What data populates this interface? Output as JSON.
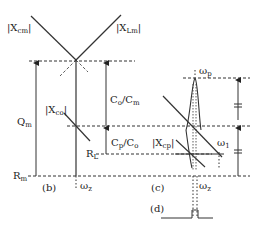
{
  "figure": {
    "panels": {
      "b": "(b)",
      "c": "(c)",
      "d": "(d)"
    },
    "labels": {
      "xcm": {
        "main": "|X",
        "sub": "cm",
        "end": "|"
      },
      "xlm": {
        "main": "|X",
        "sub": "Lm",
        "end": "|"
      },
      "xco": {
        "main": "|X",
        "sub": "co",
        "end": "|"
      },
      "xcp": {
        "main": "|X",
        "sub": "cp",
        "end": "|"
      },
      "qm": {
        "main": "Q",
        "sub": "m"
      },
      "co_cm": {
        "main": "C",
        "sub1": "o",
        "mid": "/C",
        "sub2": "m"
      },
      "cp_co": {
        "main": "C",
        "sub1": "p",
        "mid": "/C",
        "sub2": "o"
      },
      "rl": {
        "main": "R",
        "sub": "L"
      },
      "rm": {
        "main": "R",
        "sub": "m"
      },
      "wz_b": {
        "main": "ω",
        "sub": "z"
      },
      "wz_c": {
        "main": "ω",
        "sub": "z"
      },
      "wp": {
        "main": "ω",
        "sub": "p"
      },
      "w1": {
        "main": "ω",
        "sub": "1"
      }
    },
    "colors": {
      "stroke": "#333333",
      "background": "#ffffff"
    }
  }
}
